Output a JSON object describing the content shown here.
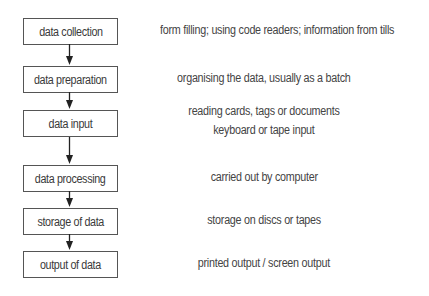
{
  "diagram": {
    "type": "flowchart",
    "direction": "top-to-bottom",
    "steps": [
      {
        "label": "data collection",
        "description": [
          "form filling; using code readers; information from tills"
        ]
      },
      {
        "label": "data preparation",
        "description": [
          "organising the data, usually as a batch"
        ]
      },
      {
        "label": "data input",
        "description": [
          "reading cards, tags or documents",
          "keyboard or tape input"
        ]
      },
      {
        "label": "data processing",
        "description": [
          "carried out by computer"
        ]
      },
      {
        "label": "storage of data",
        "description": [
          "storage on discs or tapes"
        ]
      },
      {
        "label": "output of data",
        "description": [
          "printed output / screen output"
        ]
      }
    ],
    "colors": {
      "border": "#555555",
      "text": "#3a3a3a",
      "arrow": "#222222",
      "background": "#ffffff"
    }
  }
}
